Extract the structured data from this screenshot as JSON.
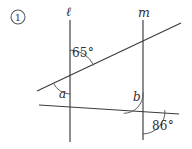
{
  "figure": {
    "problem_number": "1",
    "badge_shape": "circled-number",
    "background_color": "#ffffff",
    "line_color": "#3b3b3f",
    "text_color": "#2f2f33",
    "arc_color": "#55555a",
    "lines": [
      {
        "name": "line-l",
        "label": "ℓ",
        "orientation": "vertical",
        "x1": 70,
        "y1": 20,
        "x2": 70,
        "y2": 142,
        "label_x": 66,
        "label_y": 6
      },
      {
        "name": "line-m",
        "label": "m",
        "orientation": "vertical",
        "x1": 143,
        "y1": 20,
        "x2": 143,
        "y2": 140,
        "label_x": 138,
        "label_y": 7
      },
      {
        "name": "transversal-upper",
        "label": "",
        "orientation": "oblique",
        "x1": 37,
        "y1": 91,
        "x2": 181,
        "y2": 23,
        "label_x": 0,
        "label_y": 0
      },
      {
        "name": "transversal-lower",
        "label": "",
        "orientation": "oblique",
        "x1": 39,
        "y1": 105,
        "x2": 179,
        "y2": 114,
        "label_x": 0,
        "label_y": 0
      }
    ],
    "intersections": [
      {
        "name": "upper-transversal-meets-l",
        "x": 70,
        "y": 76
      },
      {
        "name": "upper-transversal-meets-m",
        "x": 143,
        "y": 41
      },
      {
        "name": "lower-transversal-meets-l",
        "x": 70,
        "y": 107
      },
      {
        "name": "lower-transversal-meets-m",
        "x": 143,
        "y": 112
      }
    ],
    "angles": [
      {
        "name": "angle-65",
        "label": "65°",
        "value": 65,
        "unit": "degrees",
        "known": true,
        "vertex_x": 70,
        "vertex_y": 76,
        "label_x": 72,
        "label_y": 47,
        "arc_radius": 26,
        "arc_start_deg": 90,
        "arc_end_deg": 25
      },
      {
        "name": "angle-a",
        "label": "a",
        "value": null,
        "unit": "degrees",
        "known": false,
        "vertex_x": 70,
        "vertex_y": 76,
        "label_x": 59,
        "label_y": 88,
        "arc_radius": 18,
        "arc_start_deg": 205,
        "arc_end_deg": 270
      },
      {
        "name": "angle-b",
        "label": "b",
        "value": null,
        "unit": "degrees",
        "known": false,
        "vertex_x": 143,
        "vertex_y": 112,
        "label_x": 133,
        "label_y": 91,
        "arc_radius": 19,
        "arc_start_deg": 90,
        "arc_end_deg": 184
      },
      {
        "name": "angle-86",
        "label": "86°",
        "value": 86,
        "unit": "degrees",
        "known": true,
        "vertex_x": 143,
        "vertex_y": 112,
        "label_x": 152,
        "label_y": 120,
        "arc_radius": 22,
        "arc_start_deg": 356,
        "arc_end_deg": 270
      }
    ]
  }
}
